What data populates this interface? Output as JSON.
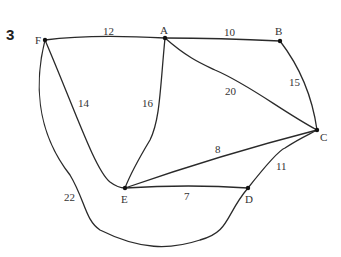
{
  "question_number": "3",
  "graph": {
    "nodes": [
      {
        "id": "F",
        "label": "F"
      },
      {
        "id": "A",
        "label": "A"
      },
      {
        "id": "B",
        "label": "B"
      },
      {
        "id": "C",
        "label": "C"
      },
      {
        "id": "D",
        "label": "D"
      },
      {
        "id": "E",
        "label": "E"
      }
    ],
    "edges": [
      {
        "from": "F",
        "to": "A",
        "weight": "12"
      },
      {
        "from": "A",
        "to": "B",
        "weight": "10"
      },
      {
        "from": "B",
        "to": "C",
        "weight": "15"
      },
      {
        "from": "A",
        "to": "C",
        "weight": "20"
      },
      {
        "from": "F",
        "to": "E",
        "weight": "14"
      },
      {
        "from": "A",
        "to": "E",
        "weight": "16"
      },
      {
        "from": "E",
        "to": "C",
        "weight": "8"
      },
      {
        "from": "E",
        "to": "D",
        "weight": "7"
      },
      {
        "from": "D",
        "to": "C",
        "weight": "11"
      },
      {
        "from": "F",
        "to": "D",
        "weight": "22"
      }
    ]
  }
}
